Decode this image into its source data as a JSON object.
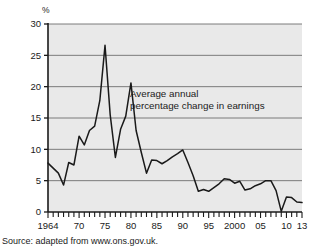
{
  "figure": {
    "unit_label": "%",
    "annotation_line1": "Average annual",
    "annotation_line2": "percentage change in earnings",
    "source_note": "Source: adapted from www.ons.gov.uk.",
    "plot_bg_color": "#e9e9e9",
    "gridline_color": "#6e6e6e",
    "axis_color": "#1a1a1a",
    "series_color": "#1a1a1a"
  },
  "chart_data": {
    "type": "line",
    "title": "",
    "subtitle": "",
    "xlabel": "",
    "ylabel": "%",
    "annotations": [
      "Average annual",
      "percentage change in earnings"
    ],
    "source": "Source: adapted from www.ons.gov.uk.",
    "grid": true,
    "grid_axis": "y",
    "legend": "none",
    "xlim": [
      1964,
      2013
    ],
    "ylim": [
      0,
      30
    ],
    "yticks": [
      0,
      5,
      10,
      15,
      20,
      25,
      30
    ],
    "ytick_labels": [
      "0",
      "5",
      "10",
      "15",
      "20",
      "25",
      "30"
    ],
    "xticks": [
      1964,
      1970,
      1975,
      1980,
      1985,
      1990,
      1995,
      2000,
      2005,
      2010,
      2013
    ],
    "xtick_labels": [
      "1964",
      "70",
      "75",
      "80",
      "85",
      "90",
      "95",
      "2000",
      "05",
      "10",
      "13"
    ],
    "xtick_minor_interval": 1,
    "series": [
      {
        "name": "Average annual percentage change in earnings",
        "x": [
          1964,
          1965,
          1966,
          1967,
          1968,
          1969,
          1970,
          1971,
          1972,
          1973,
          1974,
          1975,
          1976,
          1977,
          1978,
          1979,
          1980,
          1981,
          1982,
          1983,
          1984,
          1985,
          1986,
          1987,
          1988,
          1989,
          1990,
          1991,
          1992,
          1993,
          1994,
          1995,
          1996,
          1997,
          1998,
          1999,
          2000,
          2001,
          2002,
          2003,
          2004,
          2005,
          2006,
          2007,
          2008,
          2009,
          2010,
          2011,
          2012,
          2013
        ],
        "values": [
          7.8,
          7.0,
          6.2,
          4.3,
          7.9,
          7.5,
          12.1,
          10.7,
          13.0,
          13.7,
          17.8,
          26.6,
          15.5,
          8.7,
          13.2,
          15.3,
          20.6,
          13.0,
          9.5,
          6.2,
          8.3,
          8.2,
          7.7,
          8.2,
          8.8,
          9.3,
          9.9,
          7.9,
          5.8,
          3.3,
          3.6,
          3.3,
          3.9,
          4.5,
          5.3,
          5.2,
          4.6,
          4.9,
          3.5,
          3.7,
          4.2,
          4.5,
          5.0,
          5.0,
          3.4,
          0.1,
          2.4,
          2.3,
          1.6,
          1.5
        ]
      }
    ]
  }
}
